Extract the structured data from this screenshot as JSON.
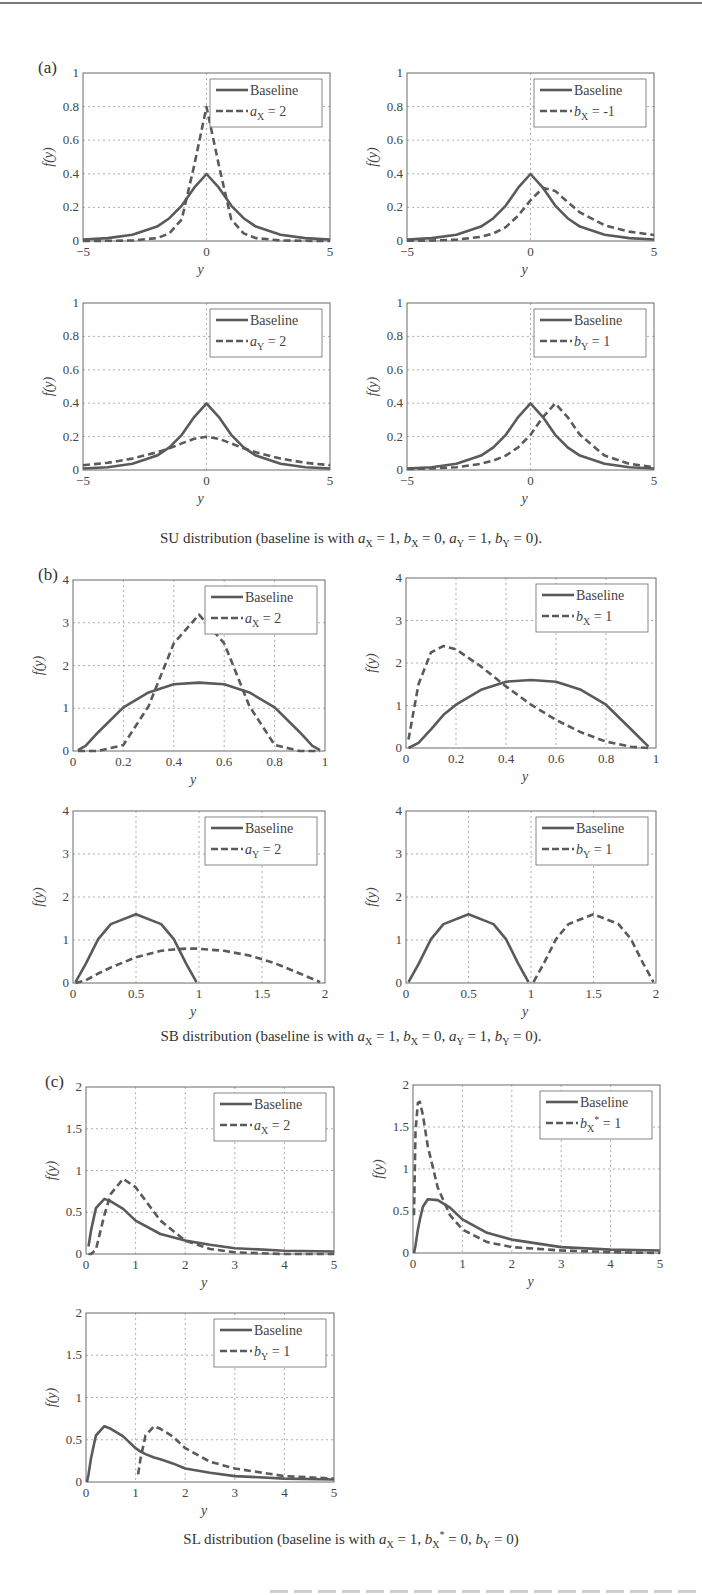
{
  "figure": {
    "panels": [
      {
        "label": "(a)",
        "caption_prefix": "SU distribution (baseline is with ",
        "caption_params": "a_X = 1, b_X = 0, a_Y = 1, b_Y = 0",
        "caption_suffix": ")."
      },
      {
        "label": "(b)",
        "caption_prefix": "SB distribution (baseline is with ",
        "caption_params": "a_X = 1, b_X = 0, a_Y = 1, b_Y = 0",
        "caption_suffix": ")."
      },
      {
        "label": "(c)",
        "caption_prefix": "SL distribution (baseline is with ",
        "caption_params": "a_X = 1, b_X* = 0, b_Y = 0",
        "caption_suffix": ")"
      }
    ],
    "legend_baseline": "Baseline",
    "ylabel": "f(y)",
    "xlabel": "y",
    "colors": {
      "line": "#5a5a5a",
      "grid": "#9a9a9a",
      "axes": "#6a6a6a",
      "text": "#3a3a3a"
    }
  },
  "chart_data": [
    {
      "id": "a1",
      "type": "line",
      "panel": "(a)",
      "title": "",
      "xlabel": "y",
      "ylabel": "f(y)",
      "xlim": [
        -5,
        5
      ],
      "ylim": [
        0,
        1
      ],
      "xticks": [
        "-5",
        "0",
        "5"
      ],
      "yticks": [
        "0",
        "0.2",
        "0.4",
        "0.6",
        "0.8",
        "1"
      ],
      "grid": true,
      "legend_position": "upper right",
      "x": [
        -5,
        -4,
        -3,
        -2,
        -1.5,
        -1,
        -0.5,
        0,
        0.5,
        1,
        1.5,
        2,
        3,
        4,
        5
      ],
      "series": [
        {
          "name": "Baseline",
          "style": "solid",
          "values": [
            0.009,
            0.017,
            0.037,
            0.086,
            0.136,
            0.211,
            0.317,
            0.399,
            0.317,
            0.211,
            0.136,
            0.086,
            0.037,
            0.017,
            0.009
          ]
        },
        {
          "name": "a_X = 2",
          "style": "dashed",
          "values": [
            0.0,
            0.001,
            0.003,
            0.017,
            0.045,
            0.129,
            0.45,
            0.798,
            0.45,
            0.129,
            0.045,
            0.017,
            0.003,
            0.001,
            0.0
          ]
        }
      ]
    },
    {
      "id": "a2",
      "type": "line",
      "panel": "(a)",
      "title": "",
      "xlabel": "y",
      "ylabel": "f(y)",
      "xlim": [
        -5,
        5
      ],
      "ylim": [
        0,
        1
      ],
      "xticks": [
        "-5",
        "0",
        "5"
      ],
      "yticks": [
        "0",
        "0.2",
        "0.4",
        "0.6",
        "0.8",
        "1"
      ],
      "grid": true,
      "legend_position": "upper right",
      "x": [
        -5,
        -4,
        -3,
        -2,
        -1.5,
        -1,
        -0.5,
        0,
        0.5,
        1,
        1.5,
        2,
        3,
        4,
        5
      ],
      "series": [
        {
          "name": "Baseline",
          "style": "solid",
          "values": [
            0.009,
            0.017,
            0.037,
            0.086,
            0.136,
            0.211,
            0.317,
            0.399,
            0.317,
            0.211,
            0.136,
            0.086,
            0.037,
            0.017,
            0.009
          ]
        },
        {
          "name": "b_X = -1",
          "style": "dashed",
          "values": [
            0.001,
            0.003,
            0.008,
            0.025,
            0.045,
            0.083,
            0.151,
            0.242,
            0.316,
            0.298,
            0.232,
            0.17,
            0.094,
            0.056,
            0.036
          ]
        }
      ]
    },
    {
      "id": "a3",
      "type": "line",
      "panel": "(a)",
      "title": "",
      "xlabel": "y",
      "ylabel": "f(y)",
      "xlim": [
        -5,
        5
      ],
      "ylim": [
        0,
        1
      ],
      "xticks": [
        "-5",
        "0",
        "5"
      ],
      "yticks": [
        "0",
        "0.2",
        "0.4",
        "0.6",
        "0.8",
        "1"
      ],
      "grid": true,
      "legend_position": "upper right",
      "x": [
        -5,
        -4,
        -3,
        -2,
        -1.5,
        -1,
        -0.5,
        0,
        0.5,
        1,
        1.5,
        2,
        3,
        4,
        5
      ],
      "series": [
        {
          "name": "Baseline",
          "style": "solid",
          "values": [
            0.009,
            0.017,
            0.037,
            0.086,
            0.136,
            0.211,
            0.317,
            0.399,
            0.317,
            0.211,
            0.136,
            0.086,
            0.037,
            0.017,
            0.009
          ]
        },
        {
          "name": "a_Y = 2",
          "style": "dashed",
          "values": [
            0.029,
            0.043,
            0.068,
            0.106,
            0.13,
            0.159,
            0.187,
            0.199,
            0.187,
            0.159,
            0.13,
            0.106,
            0.068,
            0.043,
            0.029
          ]
        }
      ]
    },
    {
      "id": "a4",
      "type": "line",
      "panel": "(a)",
      "title": "",
      "xlabel": "y",
      "ylabel": "f(y)",
      "xlim": [
        -5,
        5
      ],
      "ylim": [
        0,
        1
      ],
      "xticks": [
        "-5",
        "0",
        "5"
      ],
      "yticks": [
        "0",
        "0.2",
        "0.4",
        "0.6",
        "0.8",
        "1"
      ],
      "grid": true,
      "legend_position": "upper right",
      "x": [
        -5,
        -4,
        -3,
        -2,
        -1.5,
        -1,
        -0.5,
        0,
        0.5,
        1,
        1.5,
        2,
        3,
        4,
        5
      ],
      "series": [
        {
          "name": "Baseline",
          "style": "solid",
          "values": [
            0.009,
            0.017,
            0.037,
            0.086,
            0.136,
            0.211,
            0.317,
            0.399,
            0.317,
            0.211,
            0.136,
            0.086,
            0.037,
            0.017,
            0.009
          ]
        },
        {
          "name": "b_Y = 1",
          "style": "dashed",
          "values": [
            0.006,
            0.009,
            0.017,
            0.037,
            0.057,
            0.086,
            0.136,
            0.211,
            0.317,
            0.399,
            0.317,
            0.211,
            0.086,
            0.037,
            0.017
          ]
        }
      ]
    },
    {
      "id": "b1",
      "type": "line",
      "panel": "(b)",
      "title": "",
      "xlabel": "y",
      "ylabel": "f(y)",
      "xlim": [
        0,
        1
      ],
      "ylim": [
        0,
        4
      ],
      "xticks": [
        "0",
        "0.2",
        "0.4",
        "0.6",
        "0.8",
        "1"
      ],
      "yticks": [
        "0",
        "1",
        "2",
        "3",
        "4"
      ],
      "grid": true,
      "legend_position": "upper right",
      "x": [
        0.02,
        0.05,
        0.1,
        0.2,
        0.3,
        0.4,
        0.5,
        0.6,
        0.7,
        0.8,
        0.9,
        0.95,
        0.98
      ],
      "series": [
        {
          "name": "Baseline",
          "style": "solid",
          "values": [
            0.02,
            0.12,
            0.44,
            1.02,
            1.37,
            1.56,
            1.6,
            1.56,
            1.37,
            1.02,
            0.44,
            0.12,
            0.02
          ]
        },
        {
          "name": "a_X = 2",
          "style": "dashed",
          "values": [
            0.0,
            0.0,
            0.0,
            0.14,
            1.05,
            2.52,
            3.19,
            2.52,
            1.05,
            0.14,
            0.0,
            0.0,
            0.0
          ]
        }
      ]
    },
    {
      "id": "b2",
      "type": "line",
      "panel": "(b)",
      "title": "",
      "xlabel": "y",
      "ylabel": "f(y)",
      "xlim": [
        0,
        1
      ],
      "ylim": [
        0,
        4
      ],
      "xticks": [
        "0",
        "0.2",
        "0.4",
        "0.6",
        "0.8",
        "1"
      ],
      "yticks": [
        "0",
        "1",
        "2",
        "3",
        "4"
      ],
      "grid": true,
      "legend_position": "upper right",
      "x": [
        0.01,
        0.05,
        0.1,
        0.15,
        0.2,
        0.3,
        0.4,
        0.5,
        0.6,
        0.7,
        0.8,
        0.9,
        0.97
      ],
      "series": [
        {
          "name": "Baseline",
          "style": "solid",
          "values": [
            0.0,
            0.12,
            0.44,
            0.78,
            1.02,
            1.37,
            1.56,
            1.6,
            1.56,
            1.37,
            1.02,
            0.44,
            0.03
          ]
        },
        {
          "name": "b_X = 1",
          "style": "dashed",
          "values": [
            0.2,
            1.5,
            2.25,
            2.4,
            2.32,
            1.92,
            1.45,
            1.02,
            0.66,
            0.37,
            0.15,
            0.03,
            0.0
          ]
        }
      ]
    },
    {
      "id": "b3",
      "type": "line",
      "panel": "(b)",
      "title": "",
      "xlabel": "y",
      "ylabel": "f(y)",
      "xlim": [
        0,
        2
      ],
      "ylim": [
        0,
        4
      ],
      "xticks": [
        "0",
        "0.5",
        "1",
        "1.5",
        "2"
      ],
      "yticks": [
        "0",
        "1",
        "2",
        "3",
        "4"
      ],
      "grid": true,
      "legend_position": "upper right",
      "x": [
        0.02,
        0.1,
        0.2,
        0.3,
        0.5,
        0.7,
        0.8,
        0.9,
        0.98,
        1.2,
        1.4,
        1.6,
        1.8,
        1.96
      ],
      "series": [
        {
          "name": "Baseline",
          "style": "solid",
          "values": [
            0.02,
            0.44,
            1.02,
            1.37,
            1.6,
            1.37,
            1.02,
            0.44,
            0.02,
            null,
            null,
            null,
            null,
            null
          ]
        },
        {
          "name": "a_Y = 2",
          "style": "dashed",
          "values": [
            0.0,
            0.06,
            0.22,
            0.36,
            0.6,
            0.75,
            0.78,
            0.8,
            0.8,
            0.75,
            0.64,
            0.46,
            0.22,
            0.02
          ]
        }
      ]
    },
    {
      "id": "b4",
      "type": "line",
      "panel": "(b)",
      "title": "",
      "xlabel": "y",
      "ylabel": "f(y)",
      "xlim": [
        0,
        2
      ],
      "ylim": [
        0,
        4
      ],
      "xticks": [
        "0",
        "0.5",
        "1",
        "1.5",
        "2"
      ],
      "yticks": [
        "0",
        "1",
        "2",
        "3",
        "4"
      ],
      "grid": true,
      "legend_position": "upper right",
      "x": [
        0.02,
        0.1,
        0.2,
        0.3,
        0.5,
        0.7,
        0.8,
        0.9,
        0.98,
        1.02,
        1.1,
        1.2,
        1.3,
        1.5,
        1.7,
        1.8,
        1.9,
        1.98
      ],
      "series": [
        {
          "name": "Baseline",
          "style": "solid",
          "values": [
            0.02,
            0.44,
            1.02,
            1.37,
            1.6,
            1.37,
            1.02,
            0.44,
            0.02,
            null,
            null,
            null,
            null,
            null,
            null,
            null,
            null,
            null
          ]
        },
        {
          "name": "b_Y = 1",
          "style": "dashed",
          "values": [
            null,
            null,
            null,
            null,
            null,
            null,
            null,
            null,
            null,
            0.02,
            0.44,
            1.02,
            1.37,
            1.6,
            1.37,
            1.02,
            0.44,
            0.02
          ]
        }
      ]
    },
    {
      "id": "c1",
      "type": "line",
      "panel": "(c)",
      "title": "",
      "xlabel": "y",
      "ylabel": "f(y)",
      "xlim": [
        0,
        5
      ],
      "ylim": [
        0,
        2
      ],
      "xticks": [
        "0",
        "1",
        "2",
        "3",
        "4",
        "5"
      ],
      "yticks": [
        "0",
        "0.5",
        "1",
        "1.5",
        "2"
      ],
      "grid": true,
      "legend_position": "upper right",
      "x": [
        0.05,
        0.1,
        0.2,
        0.37,
        0.5,
        0.75,
        1,
        1.5,
        2,
        2.5,
        3,
        4,
        5
      ],
      "series": [
        {
          "name": "Baseline",
          "style": "solid",
          "values": [
            0.09,
            0.28,
            0.55,
            0.66,
            0.63,
            0.54,
            0.4,
            0.24,
            0.16,
            0.11,
            0.07,
            0.04,
            0.03
          ]
        },
        {
          "name": "a_X = 2",
          "style": "dashed",
          "values": [
            0.0,
            0.0,
            0.05,
            0.47,
            0.72,
            0.9,
            0.8,
            0.4,
            0.16,
            0.06,
            0.02,
            0.0,
            0.0
          ]
        }
      ]
    },
    {
      "id": "c2",
      "type": "line",
      "panel": "(c)",
      "title": "",
      "xlabel": "y",
      "ylabel": "f(y)",
      "xlim": [
        0,
        5
      ],
      "ylim": [
        0,
        2
      ],
      "xticks": [
        "0",
        "1",
        "2",
        "3",
        "4",
        "5"
      ],
      "yticks": [
        "0",
        "0.5",
        "1",
        "1.5",
        "2"
      ],
      "grid": true,
      "legend_position": "upper right",
      "x": [
        0.02,
        0.05,
        0.1,
        0.14,
        0.2,
        0.3,
        0.5,
        0.75,
        1,
        1.5,
        2,
        3,
        4,
        5
      ],
      "series": [
        {
          "name": "Baseline",
          "style": "solid",
          "values": [
            0.0,
            0.09,
            0.28,
            0.4,
            0.55,
            0.64,
            0.63,
            0.54,
            0.4,
            0.24,
            0.16,
            0.07,
            0.04,
            0.03
          ]
        },
        {
          "name": "b_X* = 1",
          "style": "dashed",
          "values": [
            0.45,
            1.45,
            1.79,
            1.8,
            1.64,
            1.27,
            0.78,
            0.45,
            0.28,
            0.13,
            0.07,
            0.03,
            0.01,
            0.0
          ]
        }
      ]
    },
    {
      "id": "c3",
      "type": "line",
      "panel": "(c)",
      "title": "",
      "xlabel": "y",
      "ylabel": "f(y)",
      "xlim": [
        0,
        5
      ],
      "ylim": [
        0,
        2
      ],
      "xticks": [
        "0",
        "1",
        "2",
        "3",
        "4",
        "5"
      ],
      "yticks": [
        "0",
        "0.5",
        "1",
        "1.5",
        "2"
      ],
      "grid": true,
      "legend_position": "upper right",
      "x": [
        0.02,
        0.05,
        0.1,
        0.2,
        0.37,
        0.5,
        0.75,
        1,
        1.05,
        1.1,
        1.2,
        1.37,
        1.5,
        1.75,
        2,
        2.5,
        3,
        4,
        5
      ],
      "series": [
        {
          "name": "Baseline",
          "style": "solid",
          "values": [
            0.0,
            0.09,
            0.28,
            0.55,
            0.66,
            0.63,
            0.54,
            0.4,
            0.38,
            0.36,
            0.33,
            0.29,
            0.27,
            0.22,
            0.16,
            0.11,
            0.07,
            0.04,
            0.03
          ]
        },
        {
          "name": "b_Y = 1",
          "style": "dashed",
          "values": [
            null,
            null,
            null,
            null,
            null,
            null,
            null,
            null,
            0.09,
            0.28,
            0.55,
            0.66,
            0.63,
            0.54,
            0.4,
            0.24,
            0.16,
            0.07,
            0.04
          ]
        }
      ]
    }
  ]
}
